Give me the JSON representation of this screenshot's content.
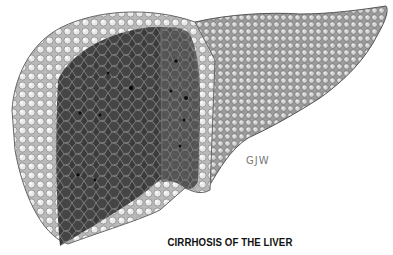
{
  "illustration": {
    "subject": "cirrhotic liver with cut section",
    "caption": "CIRRHOSIS OF THE LIVER",
    "signature": "GJW",
    "colors": {
      "background": "#ffffff",
      "surface_light": "#e6e6e6",
      "surface_mid": "#a8a8a8",
      "cut_section_dark": "#3a3a3a",
      "nodule_lines": "#8a8a8a",
      "caption_text": "#111111"
    }
  }
}
